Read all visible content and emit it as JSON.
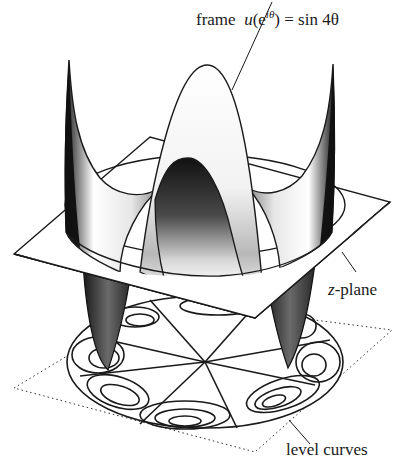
{
  "figure": {
    "labels": {
      "frame_prefix": "frame",
      "frame_func": "u",
      "frame_arg_open": "(e",
      "frame_exp": "iθ",
      "frame_arg_close": ")",
      "frame_rhs": " = sin 4θ",
      "zplane_var": "z",
      "zplane_suffix": "-plane",
      "level_curves": "level curves"
    },
    "colors": {
      "ink": "#1a1a1a",
      "background": "#ffffff",
      "shade_dark": "#2a2a2a",
      "shade_light": "#f4f4f4"
    }
  }
}
